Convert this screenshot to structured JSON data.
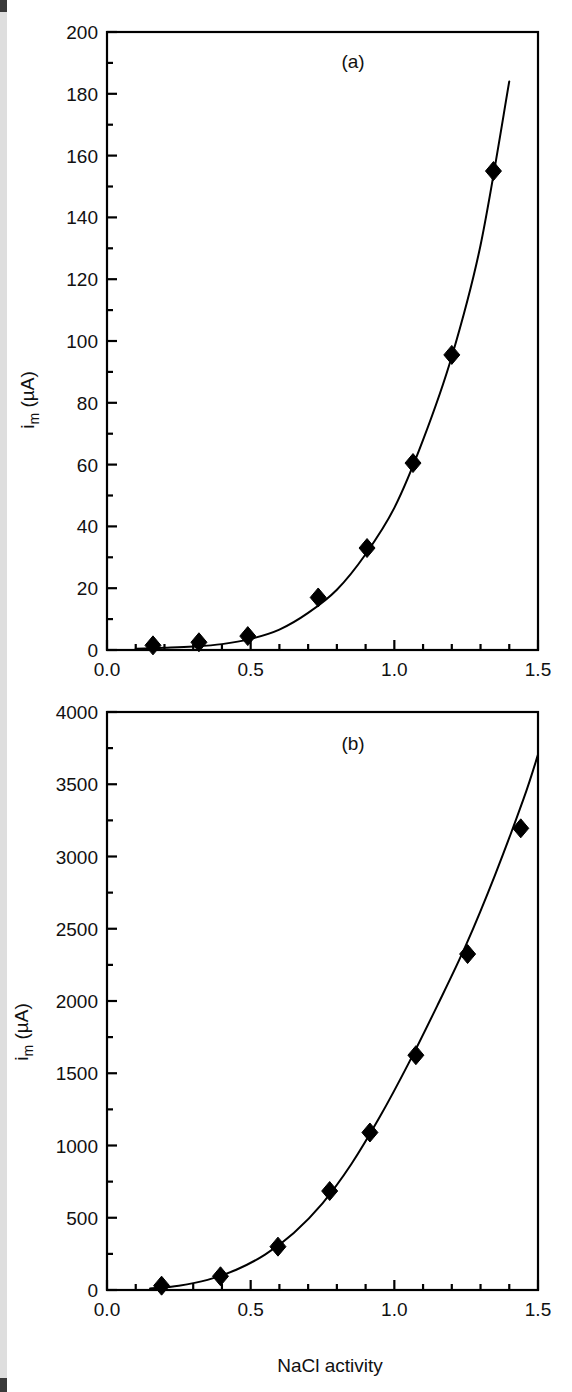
{
  "figure": {
    "background_color": "#ffffff",
    "ink_color": "#000000",
    "panels": [
      {
        "id": "a",
        "label": "(a)"
      },
      {
        "id": "b",
        "label": "(b)"
      }
    ]
  },
  "chart_data": [
    {
      "type": "scatter",
      "panel": "(a)",
      "title": "",
      "xlabel": "",
      "ylabel": "i_m (µA)",
      "ylabel_display": "i",
      "ylabel_sub": "m",
      "ylabel_unit": "(µA)",
      "xlim": [
        0.0,
        1.5
      ],
      "ylim": [
        0,
        200
      ],
      "xticks": [
        0.0,
        0.5,
        1.0,
        1.5
      ],
      "xticklabels": [
        "0.0",
        "0.5",
        "1.0",
        "1.5"
      ],
      "xtick_minor_step": 0.1,
      "yticks": [
        0,
        20,
        40,
        60,
        80,
        100,
        120,
        140,
        160,
        180,
        200
      ],
      "yticklabels": [
        "0",
        "20",
        "40",
        "60",
        "80",
        "100",
        "120",
        "140",
        "160",
        "180",
        "200"
      ],
      "ytick_minor_step": 10,
      "grid": false,
      "legend": "none",
      "marker": "filled-diamond",
      "points": [
        {
          "x": 0.16,
          "y": 1.5
        },
        {
          "x": 0.32,
          "y": 2.5
        },
        {
          "x": 0.49,
          "y": 4.5
        },
        {
          "x": 0.735,
          "y": 17.0
        },
        {
          "x": 0.905,
          "y": 33.0
        },
        {
          "x": 1.065,
          "y": 60.5
        },
        {
          "x": 1.2,
          "y": 95.5
        },
        {
          "x": 1.345,
          "y": 155.0
        }
      ],
      "fit_curve": [
        {
          "x": 0.1,
          "y": 0.4
        },
        {
          "x": 0.2,
          "y": 0.7
        },
        {
          "x": 0.3,
          "y": 1.1
        },
        {
          "x": 0.4,
          "y": 1.9
        },
        {
          "x": 0.5,
          "y": 3.6
        },
        {
          "x": 0.6,
          "y": 6.6
        },
        {
          "x": 0.7,
          "y": 12.0
        },
        {
          "x": 0.8,
          "y": 19.5
        },
        {
          "x": 0.9,
          "y": 31.0
        },
        {
          "x": 1.0,
          "y": 46.0
        },
        {
          "x": 1.1,
          "y": 68.0
        },
        {
          "x": 1.2,
          "y": 95.0
        },
        {
          "x": 1.3,
          "y": 131.0
        },
        {
          "x": 1.4,
          "y": 184.0
        }
      ]
    },
    {
      "type": "scatter",
      "panel": "(b)",
      "title": "",
      "xlabel": "NaCl activity",
      "ylabel": "i_m (µA)",
      "ylabel_display": "i",
      "ylabel_sub": "m",
      "ylabel_unit": "(µA)",
      "xlim": [
        0.0,
        1.5
      ],
      "ylim": [
        0,
        4000
      ],
      "xticks": [
        0.0,
        0.5,
        1.0,
        1.5
      ],
      "xticklabels": [
        "0.0",
        "0.5",
        "1.0",
        "1.5"
      ],
      "xtick_minor_step": 0.1,
      "yticks": [
        0,
        500,
        1000,
        1500,
        2000,
        2500,
        3000,
        3500,
        4000
      ],
      "yticklabels": [
        "0",
        "500",
        "1000",
        "1500",
        "2000",
        "2500",
        "3000",
        "3500",
        "4000"
      ],
      "ytick_minor_step": 250,
      "grid": false,
      "legend": "none",
      "marker": "filled-diamond",
      "points": [
        {
          "x": 0.19,
          "y": 30
        },
        {
          "x": 0.395,
          "y": 95
        },
        {
          "x": 0.595,
          "y": 300
        },
        {
          "x": 0.775,
          "y": 685
        },
        {
          "x": 0.915,
          "y": 1090
        },
        {
          "x": 1.075,
          "y": 1625
        },
        {
          "x": 1.255,
          "y": 2325
        },
        {
          "x": 1.44,
          "y": 3195
        }
      ],
      "fit_curve": [
        {
          "x": 0.15,
          "y": 10
        },
        {
          "x": 0.25,
          "y": 30
        },
        {
          "x": 0.35,
          "y": 70
        },
        {
          "x": 0.45,
          "y": 140
        },
        {
          "x": 0.55,
          "y": 245
        },
        {
          "x": 0.65,
          "y": 395
        },
        {
          "x": 0.75,
          "y": 600
        },
        {
          "x": 0.85,
          "y": 870
        },
        {
          "x": 0.95,
          "y": 1200
        },
        {
          "x": 1.05,
          "y": 1570
        },
        {
          "x": 1.15,
          "y": 1970
        },
        {
          "x": 1.25,
          "y": 2390
        },
        {
          "x": 1.35,
          "y": 2870
        },
        {
          "x": 1.45,
          "y": 3400
        },
        {
          "x": 1.5,
          "y": 3705
        }
      ]
    }
  ],
  "page_edge": {
    "visible": true,
    "color": "#dedede"
  }
}
